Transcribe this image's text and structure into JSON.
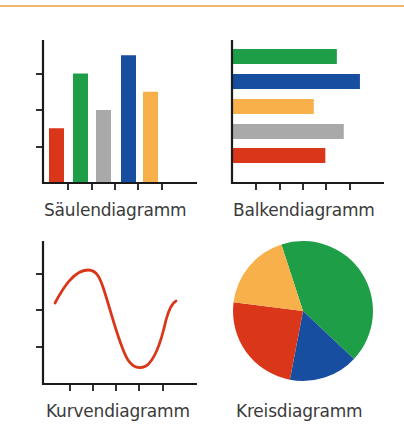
{
  "colors": {
    "red": "#d9361a",
    "green": "#1f9e48",
    "gray": "#a9a9a9",
    "blue": "#174ea0",
    "orange": "#f8b04a",
    "axis": "#1a1a1a",
    "rule": "#f2b56b"
  },
  "captions": {
    "column": "Säulendiagramm",
    "bar": "Balkendiagramm",
    "line": "Kurvendiagramm",
    "pie": "Kreisdiagramm"
  },
  "chart_data": [
    {
      "type": "bar",
      "orientation": "vertical",
      "title": "Säulendiagramm",
      "categories": [
        "1",
        "2",
        "3",
        "4",
        "5"
      ],
      "values": [
        1.5,
        3.0,
        2.0,
        3.5,
        2.5
      ],
      "colors": [
        "#d9361a",
        "#1f9e48",
        "#a9a9a9",
        "#174ea0",
        "#f8b04a"
      ],
      "xlabel": "",
      "ylabel": "",
      "ylim": [
        0,
        4
      ],
      "yticks": 3,
      "xticks": 5,
      "grid": false,
      "legend": false
    },
    {
      "type": "bar",
      "orientation": "horizontal",
      "title": "Balkendiagramm",
      "categories": [
        "1",
        "2",
        "3",
        "4",
        "5"
      ],
      "values": [
        4.5,
        5.5,
        3.5,
        4.8,
        4.0
      ],
      "colors": [
        "#1f9e48",
        "#174ea0",
        "#f8b04a",
        "#a9a9a9",
        "#d9361a"
      ],
      "xlabel": "",
      "ylabel": "",
      "xlim": [
        0,
        6.5
      ],
      "xticks": 5,
      "grid": false,
      "legend": false
    },
    {
      "type": "line",
      "title": "Kurvendiagramm",
      "x": [
        0,
        1,
        2,
        3,
        4,
        5
      ],
      "values": [
        2.2,
        3.1,
        2.5,
        0.9,
        0.5,
        2.2
      ],
      "series_color": "#d9361a",
      "xlabel": "",
      "ylabel": "",
      "ylim": [
        0,
        4
      ],
      "yticks": 3,
      "xticks": 5,
      "grid": false,
      "legend": false
    },
    {
      "type": "pie",
      "title": "Kreisdiagramm",
      "slices": [
        {
          "color": "#1f9e48",
          "value": 42
        },
        {
          "color": "#174ea0",
          "value": 16
        },
        {
          "color": "#d9361a",
          "value": 24
        },
        {
          "color": "#f8b04a",
          "value": 18
        }
      ],
      "legend": false
    }
  ]
}
